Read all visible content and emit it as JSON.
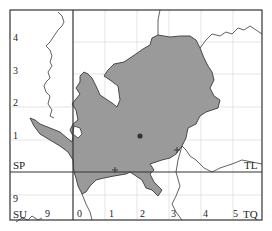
{
  "map": {
    "colors": {
      "frame": "#333333",
      "grid": "#d8d8d8",
      "fill": "#9a9a9a",
      "outline": "#3a3a3a",
      "marker": "#333333"
    },
    "square_labels": {
      "sp": "SP",
      "tl": "TL",
      "su": "SU",
      "tq": "TQ"
    },
    "y_ticks": [
      "4",
      "3",
      "2",
      "1",
      "9"
    ],
    "x_ticks": [
      "9",
      "0",
      "1",
      "2",
      "3",
      "4",
      "5"
    ],
    "markers": [
      {
        "type": "dot",
        "label": "record-dot"
      },
      {
        "type": "plus",
        "label": "record-plus"
      },
      {
        "type": "plus",
        "label": "record-plus"
      }
    ]
  }
}
